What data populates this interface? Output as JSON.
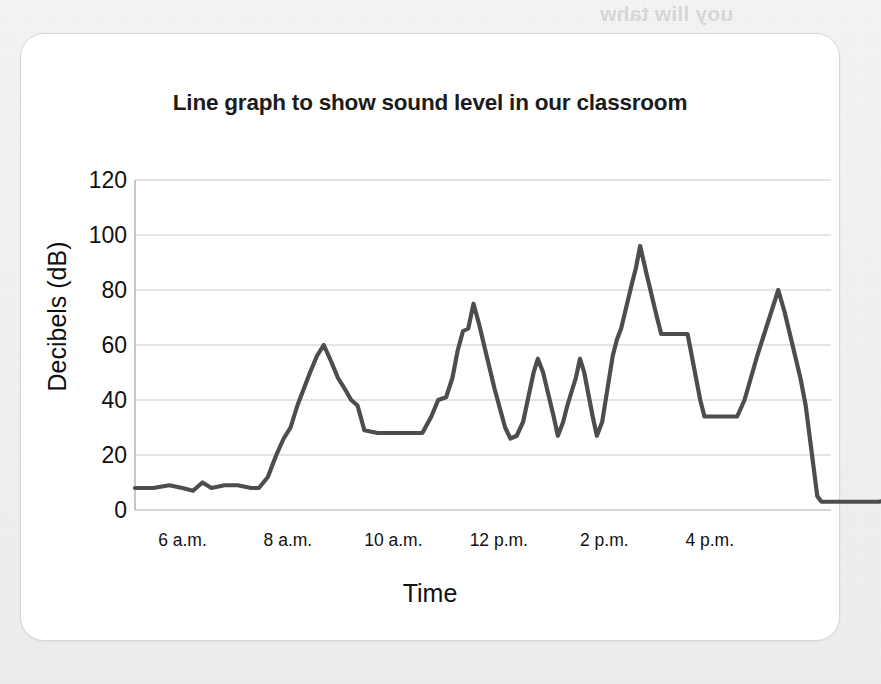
{
  "page": {
    "background_color": "#f2f2f2",
    "ghost_text": "uoy lliw tahw"
  },
  "card": {
    "background_color": "#ffffff",
    "border_color": "#d7d7d7"
  },
  "chart_data": {
    "type": "line",
    "title": "Line graph to show sound level in our classroom",
    "xlabel": "Time",
    "ylabel": "Decibels (dB)",
    "ylim": [
      0,
      120
    ],
    "y_ticks": [
      0,
      20,
      40,
      60,
      80,
      100,
      120
    ],
    "y_tick_labels": [
      "0",
      "20",
      "40",
      "60",
      "80",
      "100",
      "120"
    ],
    "x_tick_labels": [
      "6 a.m.",
      "8 a.m.",
      "10 a.m.",
      "12 p.m.",
      "2 p.m.",
      "4 p.m."
    ],
    "x_tick_positions_hours": [
      6,
      8,
      10,
      12,
      14,
      16
    ],
    "xlim_hours": [
      5.1,
      18.3
    ],
    "grid": true,
    "grid_color": "#c9c9c9",
    "legend": null,
    "line_color": "#4d4d4d",
    "line_width": 4.2,
    "series": [
      {
        "name": "Sound level",
        "points": [
          [
            5.1,
            8
          ],
          [
            5.45,
            8
          ],
          [
            5.75,
            9
          ],
          [
            6.0,
            8
          ],
          [
            6.2,
            7
          ],
          [
            6.38,
            10
          ],
          [
            6.55,
            8
          ],
          [
            6.8,
            9
          ],
          [
            7.05,
            9
          ],
          [
            7.3,
            8
          ],
          [
            7.45,
            8
          ],
          [
            7.62,
            12
          ],
          [
            7.78,
            20
          ],
          [
            7.92,
            26
          ],
          [
            8.05,
            30
          ],
          [
            8.18,
            38
          ],
          [
            8.3,
            44
          ],
          [
            8.42,
            50
          ],
          [
            8.55,
            56
          ],
          [
            8.68,
            60
          ],
          [
            8.82,
            54
          ],
          [
            8.95,
            48
          ],
          [
            9.08,
            44
          ],
          [
            9.2,
            40
          ],
          [
            9.32,
            38
          ],
          [
            9.45,
            29
          ],
          [
            9.7,
            28
          ],
          [
            10.0,
            28
          ],
          [
            10.3,
            28
          ],
          [
            10.55,
            28
          ],
          [
            10.72,
            34
          ],
          [
            10.85,
            40
          ],
          [
            11.0,
            41
          ],
          [
            11.12,
            48
          ],
          [
            11.22,
            58
          ],
          [
            11.32,
            65
          ],
          [
            11.42,
            66
          ],
          [
            11.52,
            75
          ],
          [
            11.62,
            68
          ],
          [
            11.72,
            60
          ],
          [
            11.82,
            52
          ],
          [
            11.92,
            44
          ],
          [
            12.02,
            37
          ],
          [
            12.12,
            30
          ],
          [
            12.22,
            26
          ],
          [
            12.34,
            27
          ],
          [
            12.46,
            32
          ],
          [
            12.56,
            41
          ],
          [
            12.66,
            50
          ],
          [
            12.74,
            55
          ],
          [
            12.84,
            50
          ],
          [
            12.94,
            42
          ],
          [
            13.04,
            34
          ],
          [
            13.12,
            27
          ],
          [
            13.22,
            32
          ],
          [
            13.3,
            38
          ],
          [
            13.38,
            43
          ],
          [
            13.46,
            48
          ],
          [
            13.54,
            55
          ],
          [
            13.62,
            50
          ],
          [
            13.7,
            42
          ],
          [
            13.78,
            34
          ],
          [
            13.86,
            27
          ],
          [
            13.96,
            32
          ],
          [
            14.06,
            44
          ],
          [
            14.16,
            56
          ],
          [
            14.24,
            62
          ],
          [
            14.32,
            66
          ],
          [
            14.42,
            74
          ],
          [
            14.52,
            82
          ],
          [
            14.6,
            88
          ],
          [
            14.68,
            96
          ],
          [
            14.8,
            86
          ],
          [
            14.9,
            78
          ],
          [
            15.0,
            70
          ],
          [
            15.08,
            64
          ],
          [
            15.24,
            64
          ],
          [
            15.44,
            64
          ],
          [
            15.58,
            64
          ],
          [
            15.66,
            56
          ],
          [
            15.74,
            48
          ],
          [
            15.82,
            40
          ],
          [
            15.9,
            34
          ],
          [
            16.12,
            34
          ],
          [
            16.34,
            34
          ],
          [
            16.52,
            34
          ],
          [
            16.66,
            40
          ],
          [
            16.78,
            48
          ],
          [
            16.9,
            56
          ],
          [
            17.0,
            62
          ],
          [
            17.1,
            68
          ],
          [
            17.2,
            74
          ],
          [
            17.3,
            80
          ],
          [
            17.42,
            72
          ],
          [
            17.52,
            64
          ],
          [
            17.62,
            56
          ],
          [
            17.72,
            48
          ],
          [
            17.82,
            38
          ],
          [
            17.9,
            26
          ],
          [
            17.98,
            14
          ],
          [
            18.04,
            5
          ],
          [
            18.12,
            3
          ],
          [
            18.4,
            3
          ],
          [
            18.8,
            3
          ],
          [
            19.2,
            3
          ],
          [
            19.6,
            4
          ],
          [
            19.9,
            4
          ]
        ]
      }
    ]
  }
}
